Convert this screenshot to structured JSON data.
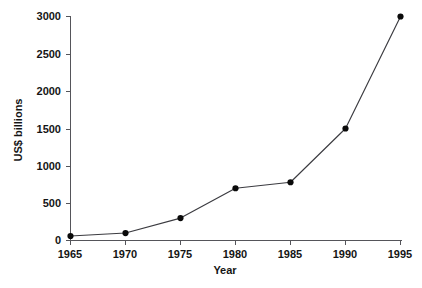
{
  "chart_data": {
    "type": "line",
    "title": "",
    "subtitle": "",
    "xlabel": "Year",
    "ylabel": "US$ billions",
    "x": [
      1965,
      1970,
      1975,
      1980,
      1985,
      1990,
      1995
    ],
    "values": [
      60,
      100,
      300,
      700,
      780,
      1500,
      3000
    ],
    "series": [
      {
        "name": "US$ billions",
        "values": [
          60,
          100,
          300,
          700,
          780,
          1500,
          3000
        ]
      }
    ],
    "xlim": [
      1965,
      1995
    ],
    "ylim": [
      0,
      3000
    ],
    "xticks": [
      1965,
      1970,
      1975,
      1980,
      1985,
      1990,
      1995
    ],
    "yticks": [
      0,
      500,
      1000,
      1500,
      2000,
      2500,
      3000
    ],
    "xtick_labels": [
      "1965",
      "1970",
      "1975",
      "1980",
      "1985",
      "1990",
      "1995"
    ],
    "ytick_labels": [
      "0",
      "500",
      "1000",
      "1500",
      "2000",
      "2500",
      "3000"
    ],
    "grid": false,
    "legend": false,
    "legend_position": "none",
    "marker": "filled-circle",
    "line_color": "#3b3b40",
    "marker_color": "#0a0a0a",
    "axis_color": "#55555a",
    "background_color": "#ffffff",
    "annotations": []
  }
}
